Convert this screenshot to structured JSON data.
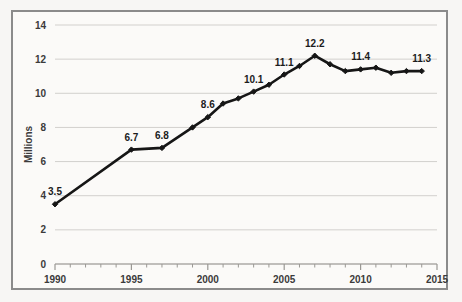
{
  "chart_data": {
    "type": "line",
    "title": "",
    "xlabel": "",
    "ylabel": "Millions",
    "xlim": [
      1990,
      2015
    ],
    "ylim": [
      0,
      14
    ],
    "grid": true,
    "legend": false,
    "y_ticks": [
      0,
      2,
      4,
      6,
      8,
      10,
      12,
      14
    ],
    "y_tick_labels": [
      "0",
      "2",
      "4",
      "6",
      "8",
      "10",
      "12",
      "14"
    ],
    "x_ticks": [
      1990,
      1995,
      2000,
      2005,
      2010,
      2015
    ],
    "x_tick_labels": [
      "1990",
      "1995",
      "2000",
      "2005",
      "2010",
      "2015"
    ],
    "x_minor_tick_step": 1,
    "series": [
      {
        "name": "Millions",
        "color": "#161616",
        "marker": "diamond",
        "x": [
          1990,
          1995,
          1997,
          1999,
          2000,
          2001,
          2002,
          2003,
          2004,
          2005,
          2006,
          2007,
          2008,
          2009,
          2010,
          2011,
          2012,
          2013,
          2014
        ],
        "values": [
          3.5,
          6.7,
          6.8,
          8.0,
          8.6,
          9.4,
          9.7,
          10.1,
          10.5,
          11.1,
          11.6,
          12.2,
          11.7,
          11.3,
          11.4,
          11.5,
          11.2,
          11.3,
          11.3
        ]
      }
    ],
    "point_labels": [
      {
        "x": 1990,
        "y": 3.5,
        "text": "3.5"
      },
      {
        "x": 1995,
        "y": 6.7,
        "text": "6.7"
      },
      {
        "x": 1997,
        "y": 6.8,
        "text": "6.8"
      },
      {
        "x": 2000,
        "y": 8.6,
        "text": "8.6"
      },
      {
        "x": 2003,
        "y": 10.1,
        "text": "10.1"
      },
      {
        "x": 2005,
        "y": 11.1,
        "text": "11.1"
      },
      {
        "x": 2007,
        "y": 12.2,
        "text": "12.2"
      },
      {
        "x": 2010,
        "y": 11.4,
        "text": "11.4"
      },
      {
        "x": 2014,
        "y": 11.3,
        "text": "11.3"
      }
    ],
    "colors": {
      "series": "#161616",
      "gridline": "#d2d0cd",
      "axis": "#9a9894",
      "frame_border": "#8b8b8b",
      "plot_background": "#fbfaf8",
      "figure_background": "#f7f6f4",
      "tick_text": "#3b3b3b"
    }
  }
}
